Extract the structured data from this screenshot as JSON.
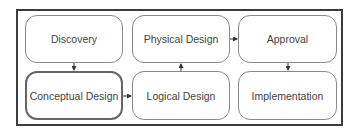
{
  "diagram": {
    "nodes": [
      {
        "id": "discovery",
        "label": "Discovery"
      },
      {
        "id": "physical",
        "label": "Physical Design"
      },
      {
        "id": "approval",
        "label": "Approval"
      },
      {
        "id": "conceptual",
        "label": "Conceptual Design",
        "highlighted": true
      },
      {
        "id": "logical",
        "label": "Logical Design"
      },
      {
        "id": "implementation",
        "label": "Implementation"
      }
    ],
    "edges": [
      {
        "from": "discovery",
        "to": "conceptual"
      },
      {
        "from": "conceptual",
        "to": "logical"
      },
      {
        "from": "logical",
        "to": "physical"
      },
      {
        "from": "physical",
        "to": "approval"
      },
      {
        "from": "approval",
        "to": "implementation"
      }
    ],
    "colors": {
      "frame": "#3c3c3c",
      "box_border": "#8a8a8a",
      "highlight_border": "#666666",
      "text": "#444444"
    }
  }
}
